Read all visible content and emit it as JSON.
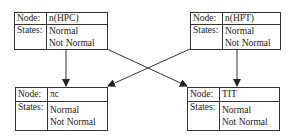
{
  "nodes": [
    {
      "id": "n_hpc",
      "node_label": "Node:",
      "name": "n(HPC)",
      "states_label": "States:",
      "states": [
        "Normal",
        "Not Normal"
      ]
    },
    {
      "id": "n_hpt",
      "node_label": "Node:",
      "name": "n(HPT)",
      "states_label": "States:",
      "states": [
        "Normal",
        "Not Normal"
      ]
    },
    {
      "id": "pi_c",
      "node_label": "Node:",
      "name": "πc",
      "states_label": "States:",
      "states": [
        "Normal",
        "Not Normal"
      ]
    },
    {
      "id": "tit",
      "node_label": "Node:",
      "name": "TIT",
      "states_label": "States:",
      "states": [
        "Normal",
        "Not Normal"
      ]
    }
  ],
  "edges": [
    {
      "from": "n(HPC)",
      "to": "πc"
    },
    {
      "from": "n(HPC)",
      "to": "TIT"
    },
    {
      "from": "n(HPT)",
      "to": "πc"
    },
    {
      "from": "n(HPT)",
      "to": "TIT"
    }
  ]
}
